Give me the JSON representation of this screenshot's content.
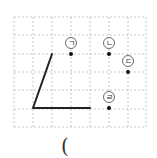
{
  "diagram": {
    "type": "dot-grid-angle-problem",
    "grid": {
      "cols": 7,
      "rows": 6,
      "x_lines": [
        14,
        33,
        52,
        71,
        90,
        109,
        128,
        146
      ],
      "y_lines": [
        17,
        35,
        54,
        72,
        90,
        109,
        127
      ],
      "line_color": "#bbbbbb"
    },
    "angle": {
      "points": [
        [
          52,
          54
        ],
        [
          33,
          108
        ],
        [
          90,
          108
        ]
      ],
      "color": "#222222"
    },
    "choices": [
      {
        "label": "ㄱ",
        "dot": [
          71,
          54
        ],
        "circle": [
          71,
          43
        ]
      },
      {
        "label": "ㄴ",
        "dot": [
          109,
          54
        ],
        "circle": [
          109,
          43
        ]
      },
      {
        "label": "ㄷ",
        "dot": [
          128,
          72
        ],
        "circle": [
          128,
          61
        ]
      },
      {
        "label": "ㄹ",
        "dot": [
          109,
          108
        ],
        "circle": [
          109,
          97
        ]
      }
    ],
    "answer_bracket": "("
  }
}
